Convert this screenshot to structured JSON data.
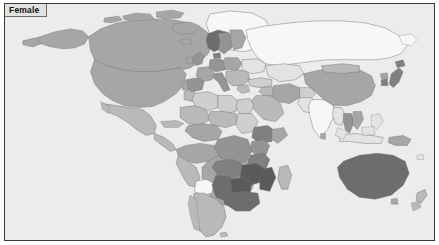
{
  "figure": {
    "panel_label": "Female",
    "background_color": "#ececec",
    "border_color": "#3a3a3a",
    "label_background": "#e2e2e2"
  },
  "map": {
    "type": "choropleth-world-map",
    "projection": "equirectangular",
    "coastline_color": "#6e6e6e",
    "ocean_color": "#ececec",
    "antarctica_shown": false,
    "shade_scale": {
      "nodata": "#f7f7f7",
      "lightest": "#e3e3e3",
      "light": "#cfcfcf",
      "medium_light": "#b9b9b9",
      "medium": "#a6a6a6",
      "medium_dark": "#949494",
      "dark": "#808080",
      "darker": "#6d6d6d",
      "darkest": "#5a5a5a"
    },
    "regions": [
      {
        "name": "Greenland",
        "shade": "nodata"
      },
      {
        "name": "Canada",
        "shade": "medium"
      },
      {
        "name": "United States",
        "shade": "medium"
      },
      {
        "name": "Alaska",
        "shade": "medium"
      },
      {
        "name": "Mexico",
        "shade": "medium_light"
      },
      {
        "name": "Central America",
        "shade": "medium_light"
      },
      {
        "name": "Caribbean",
        "shade": "medium_light"
      },
      {
        "name": "Colombia",
        "shade": "medium"
      },
      {
        "name": "Venezuela",
        "shade": "medium"
      },
      {
        "name": "Guyanas",
        "shade": "nodata"
      },
      {
        "name": "Brazil",
        "shade": "medium"
      },
      {
        "name": "Peru",
        "shade": "medium_light"
      },
      {
        "name": "Bolivia",
        "shade": "nodata"
      },
      {
        "name": "Chile",
        "shade": "medium_light"
      },
      {
        "name": "Argentina",
        "shade": "medium_light"
      },
      {
        "name": "United Kingdom",
        "shade": "medium_dark"
      },
      {
        "name": "Ireland",
        "shade": "medium"
      },
      {
        "name": "Norway",
        "shade": "darker"
      },
      {
        "name": "Sweden",
        "shade": "medium_dark"
      },
      {
        "name": "Finland",
        "shade": "medium"
      },
      {
        "name": "Denmark",
        "shade": "dark"
      },
      {
        "name": "Germany",
        "shade": "medium_dark"
      },
      {
        "name": "France",
        "shade": "medium"
      },
      {
        "name": "Spain",
        "shade": "medium_dark"
      },
      {
        "name": "Portugal",
        "shade": "medium"
      },
      {
        "name": "Italy",
        "shade": "medium_dark"
      },
      {
        "name": "Poland",
        "shade": "medium"
      },
      {
        "name": "Balkans",
        "shade": "medium_light"
      },
      {
        "name": "Greece",
        "shade": "medium_light"
      },
      {
        "name": "Turkey",
        "shade": "light"
      },
      {
        "name": "Russia",
        "shade": "nodata"
      },
      {
        "name": "Ukraine",
        "shade": "lightest"
      },
      {
        "name": "Kazakhstan",
        "shade": "lightest"
      },
      {
        "name": "Iran",
        "shade": "medium"
      },
      {
        "name": "Iraq",
        "shade": "medium_light"
      },
      {
        "name": "Saudi Arabia",
        "shade": "medium_light"
      },
      {
        "name": "Egypt",
        "shade": "light"
      },
      {
        "name": "Libya",
        "shade": "light"
      },
      {
        "name": "Algeria",
        "shade": "light"
      },
      {
        "name": "Morocco",
        "shade": "medium_light"
      },
      {
        "name": "Mali",
        "shade": "medium_light"
      },
      {
        "name": "Niger",
        "shade": "medium_light"
      },
      {
        "name": "Nigeria",
        "shade": "medium"
      },
      {
        "name": "Sudan",
        "shade": "light"
      },
      {
        "name": "Ethiopia",
        "shade": "dark"
      },
      {
        "name": "Kenya",
        "shade": "medium_dark"
      },
      {
        "name": "Tanzania",
        "shade": "dark"
      },
      {
        "name": "DR Congo",
        "shade": "medium_dark"
      },
      {
        "name": "Angola",
        "shade": "dark"
      },
      {
        "name": "Zambia",
        "shade": "darkest"
      },
      {
        "name": "Zimbabwe",
        "shade": "darkest"
      },
      {
        "name": "Mozambique",
        "shade": "darkest"
      },
      {
        "name": "Botswana",
        "shade": "darkest"
      },
      {
        "name": "Namibia",
        "shade": "darker"
      },
      {
        "name": "South Africa",
        "shade": "darker"
      },
      {
        "name": "Madagascar",
        "shade": "medium_light"
      },
      {
        "name": "India",
        "shade": "nodata"
      },
      {
        "name": "Pakistan",
        "shade": "lightest"
      },
      {
        "name": "Afghanistan",
        "shade": "light"
      },
      {
        "name": "China",
        "shade": "medium"
      },
      {
        "name": "Mongolia",
        "shade": "medium_light"
      },
      {
        "name": "Japan",
        "shade": "dark"
      },
      {
        "name": "South Korea",
        "shade": "dark"
      },
      {
        "name": "Thailand",
        "shade": "medium_dark"
      },
      {
        "name": "Vietnam",
        "shade": "medium"
      },
      {
        "name": "Myanmar",
        "shade": "lightest"
      },
      {
        "name": "Indonesia",
        "shade": "lightest"
      },
      {
        "name": "Philippines",
        "shade": "lightest"
      },
      {
        "name": "Papua New Guinea",
        "shade": "medium"
      },
      {
        "name": "Australia",
        "shade": "darker"
      },
      {
        "name": "New Zealand",
        "shade": "medium_light"
      }
    ]
  }
}
